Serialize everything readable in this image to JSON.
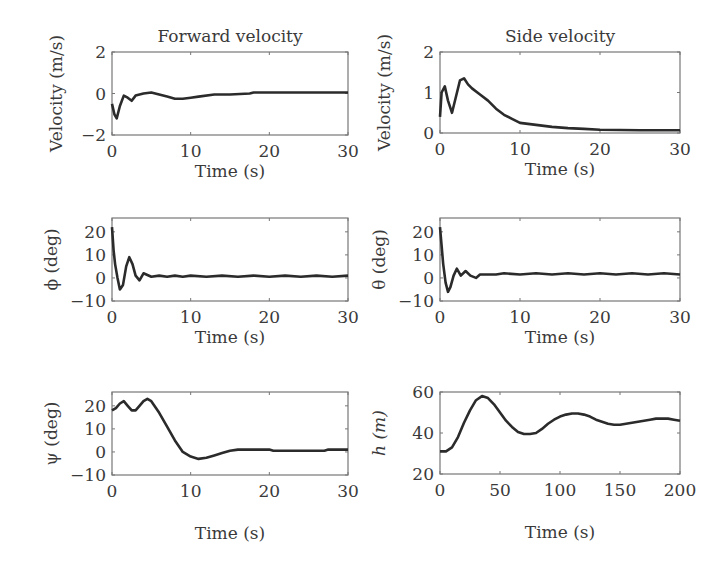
{
  "figure": {
    "panels": [
      {
        "id": "forward-velocity",
        "title": "Forward velocity",
        "xlabel": "Time (s)",
        "ylabel": "Velocity (m/s)",
        "ylabel_italic": false,
        "box": {
          "x": 112,
          "y": 52,
          "w": 236,
          "h": 83
        },
        "xlim": [
          0,
          30
        ],
        "ylim": [
          -2,
          2
        ],
        "xticks": [
          "0",
          "10",
          "20",
          "30"
        ],
        "yticks": [
          "2",
          "0",
          "−2"
        ],
        "ytick_vals": [
          2,
          0,
          -2
        ],
        "xtick_vals": [
          0,
          10,
          20,
          30
        ]
      },
      {
        "id": "side-velocity",
        "title": "Side velocity",
        "xlabel": "Time (s)",
        "ylabel": "Velocity (m/s)",
        "ylabel_italic": false,
        "box": {
          "x": 440,
          "y": 52,
          "w": 240,
          "h": 81
        },
        "xlim": [
          0,
          30
        ],
        "ylim": [
          0,
          2
        ],
        "xticks": [
          "0",
          "10",
          "20",
          "30"
        ],
        "yticks": [
          "2",
          "1",
          "0"
        ],
        "ytick_vals": [
          2,
          1,
          0
        ],
        "xtick_vals": [
          0,
          10,
          20,
          30
        ]
      },
      {
        "id": "phi",
        "title": "",
        "xlabel": "Time (s)",
        "ylabel": "ϕ (deg)",
        "ylabel_italic": false,
        "box": {
          "x": 112,
          "y": 218,
          "w": 236,
          "h": 83
        },
        "xlim": [
          0,
          30
        ],
        "ylim": [
          -10,
          26
        ],
        "xticks": [
          "0",
          "10",
          "20",
          "30"
        ],
        "yticks": [
          "20",
          "10",
          "0",
          "−10"
        ],
        "ytick_vals": [
          20,
          10,
          0,
          -10
        ],
        "xtick_vals": [
          0,
          10,
          20,
          30
        ]
      },
      {
        "id": "theta",
        "title": "",
        "xlabel": "Time (s)",
        "ylabel": "θ (deg)",
        "ylabel_italic": false,
        "box": {
          "x": 440,
          "y": 218,
          "w": 240,
          "h": 83
        },
        "xlim": [
          0,
          30
        ],
        "ylim": [
          -10,
          26
        ],
        "xticks": [
          "0",
          "10",
          "20",
          "30"
        ],
        "yticks": [
          "20",
          "10",
          "0",
          "−10"
        ],
        "ytick_vals": [
          20,
          10,
          0,
          -10
        ],
        "xtick_vals": [
          0,
          10,
          20,
          30
        ]
      },
      {
        "id": "psi",
        "title": "",
        "xlabel": "Time (s)",
        "ylabel": "ψ (deg)",
        "ylabel_italic": false,
        "box": {
          "x": 112,
          "y": 392,
          "w": 236,
          "h": 83
        },
        "xlim": [
          0,
          30
        ],
        "ylim": [
          -10,
          26
        ],
        "xticks": [
          "0",
          "10",
          "20",
          "30"
        ],
        "yticks": [
          "20",
          "10",
          "0",
          "−10"
        ],
        "ytick_vals": [
          20,
          10,
          0,
          -10
        ],
        "xtick_vals": [
          0,
          10,
          20,
          30
        ]
      },
      {
        "id": "height",
        "title": "",
        "xlabel": "Time (s)",
        "ylabel": "h (m)",
        "ylabel_italic": true,
        "box": {
          "x": 440,
          "y": 392,
          "w": 240,
          "h": 82
        },
        "xlim": [
          0,
          200
        ],
        "ylim": [
          20,
          60
        ],
        "xticks": [
          "0",
          "50",
          "100",
          "150",
          "200"
        ],
        "yticks": [
          "60",
          "40",
          "20"
        ],
        "ytick_vals": [
          60,
          40,
          20
        ],
        "xtick_vals": [
          0,
          50,
          100,
          150,
          200
        ]
      }
    ]
  },
  "chart_data": [
    {
      "type": "line",
      "title": "Forward velocity",
      "xlabel": "Time (s)",
      "ylabel": "Velocity (m/s)",
      "xlim": [
        0,
        30
      ],
      "ylim": [
        -2,
        2
      ],
      "x": [
        0,
        0.3,
        0.6,
        1.0,
        1.5,
        2.0,
        2.5,
        3.0,
        4.0,
        5.0,
        6.0,
        7.0,
        8.0,
        9.0,
        10,
        11,
        13,
        15,
        17.5,
        18,
        20,
        25,
        30
      ],
      "y": [
        -0.5,
        -1.0,
        -1.2,
        -0.6,
        -0.1,
        -0.2,
        -0.35,
        -0.1,
        0.0,
        0.05,
        -0.05,
        -0.15,
        -0.25,
        -0.25,
        -0.2,
        -0.15,
        -0.05,
        -0.05,
        0.0,
        0.05,
        0.05,
        0.05,
        0.05
      ]
    },
    {
      "type": "line",
      "title": "Side velocity",
      "xlabel": "Time (s)",
      "ylabel": "Velocity (m/s)",
      "xlim": [
        0,
        30
      ],
      "ylim": [
        0,
        2
      ],
      "x": [
        0,
        0.2,
        0.6,
        1.0,
        1.5,
        2.0,
        2.5,
        3.0,
        3.5,
        4.0,
        5.0,
        6.0,
        7.0,
        8.0,
        9.0,
        10,
        12,
        14,
        16,
        18,
        20,
        25,
        30
      ],
      "y": [
        0.4,
        1.0,
        1.15,
        0.8,
        0.5,
        0.9,
        1.3,
        1.35,
        1.2,
        1.1,
        0.95,
        0.8,
        0.6,
        0.45,
        0.35,
        0.25,
        0.2,
        0.15,
        0.12,
        0.1,
        0.08,
        0.07,
        0.07
      ]
    },
    {
      "type": "line",
      "title": "",
      "xlabel": "Time (s)",
      "ylabel": "ϕ (deg)",
      "xlim": [
        0,
        30
      ],
      "ylim": [
        -10,
        26
      ],
      "x": [
        0,
        0.2,
        0.4,
        0.7,
        1.0,
        1.4,
        1.8,
        2.2,
        2.6,
        3.0,
        3.5,
        4.0,
        5,
        6,
        7,
        8,
        9,
        10,
        12,
        14,
        16,
        18,
        20,
        22,
        24,
        26,
        28,
        30
      ],
      "y": [
        22,
        12,
        6,
        0,
        -5,
        -3,
        5,
        9,
        6,
        1,
        -1,
        2,
        0.5,
        1,
        0.5,
        1,
        0.5,
        1,
        0.5,
        1,
        0.5,
        1,
        0.5,
        1,
        0.5,
        1,
        0.5,
        1
      ]
    },
    {
      "type": "line",
      "title": "",
      "xlabel": "Time (s)",
      "ylabel": "θ (deg)",
      "xlim": [
        0,
        30
      ],
      "ylim": [
        -10,
        26
      ],
      "x": [
        0,
        0.2,
        0.4,
        0.7,
        1.0,
        1.3,
        1.7,
        2.1,
        2.6,
        3.2,
        3.8,
        4.5,
        5,
        6,
        7,
        8,
        10,
        12,
        14,
        16,
        18,
        20,
        22,
        24,
        26,
        28,
        30
      ],
      "y": [
        22,
        14,
        6,
        -2,
        -6,
        -4,
        1,
        4,
        1,
        3,
        1,
        0,
        1.5,
        1.5,
        1.5,
        2,
        1.5,
        2,
        1.5,
        2,
        1.5,
        2,
        1.5,
        2,
        1.5,
        2,
        1.5
      ]
    },
    {
      "type": "line",
      "title": "",
      "xlabel": "Time (s)",
      "ylabel": "ψ (deg)",
      "xlim": [
        0,
        30
      ],
      "ylim": [
        -10,
        26
      ],
      "x": [
        0,
        0.5,
        1.0,
        1.5,
        2.0,
        2.5,
        3.0,
        3.5,
        4.0,
        4.5,
        5.0,
        6.0,
        7.0,
        8.0,
        9.0,
        10,
        11,
        12,
        13,
        14,
        15,
        16,
        18,
        20,
        20.5,
        22,
        25,
        27,
        27.5,
        30
      ],
      "y": [
        18,
        19,
        21,
        22,
        20,
        18,
        18,
        20,
        22,
        23,
        22,
        17,
        11,
        5,
        0,
        -2,
        -3,
        -2.5,
        -1.5,
        -0.5,
        0.5,
        1,
        1,
        1,
        0.5,
        0.5,
        0.5,
        0.5,
        1,
        1
      ]
    },
    {
      "type": "line",
      "title": "",
      "xlabel": "Time (s)",
      "ylabel": "h (m)",
      "xlim": [
        0,
        200
      ],
      "ylim": [
        20,
        60
      ],
      "x": [
        0,
        5,
        10,
        15,
        20,
        25,
        30,
        35,
        40,
        45,
        50,
        55,
        60,
        65,
        70,
        75,
        80,
        85,
        90,
        95,
        100,
        105,
        110,
        115,
        120,
        125,
        130,
        135,
        140,
        145,
        150,
        155,
        160,
        165,
        170,
        175,
        180,
        185,
        190,
        195,
        200
      ],
      "y": [
        31,
        31,
        33,
        38,
        45,
        51,
        56,
        58,
        57,
        54,
        50,
        46,
        43,
        40.5,
        39.5,
        39.5,
        40,
        42,
        44.5,
        46.5,
        48,
        49,
        49.5,
        49.5,
        49,
        48,
        46.5,
        45.5,
        44.5,
        44,
        44,
        44.5,
        45,
        45.5,
        46,
        46.5,
        47,
        47,
        47,
        46.5,
        46
      ]
    }
  ]
}
